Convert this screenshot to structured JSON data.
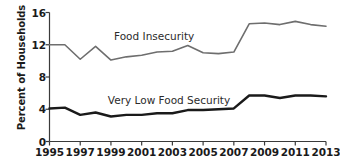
{
  "chart_data": {
    "type": "line",
    "title": "",
    "xlabel": "",
    "ylabel": "Percent of Households",
    "xlim": [
      1995,
      2013
    ],
    "ylim": [
      0,
      16
    ],
    "grid": false,
    "legend_position": "inline-annotation",
    "x": [
      1995,
      1996,
      1997,
      1998,
      1999,
      2000,
      2001,
      2002,
      2003,
      2004,
      2005,
      2006,
      2007,
      2008,
      2009,
      2010,
      2011,
      2012,
      2013
    ],
    "xticks": [
      "1995",
      "1997",
      "1999",
      "2001",
      "2003",
      "2005",
      "2007",
      "2009",
      "2011",
      "2013"
    ],
    "xtick_values": [
      1995,
      1997,
      1999,
      2001,
      2003,
      2005,
      2007,
      2009,
      2011,
      2013
    ],
    "yticks": [
      "0",
      "4",
      "8",
      "12",
      "16"
    ],
    "ytick_values": [
      0,
      4,
      8,
      12,
      16
    ],
    "series": [
      {
        "name": "Food Insecurity",
        "color": "#6e6e6e",
        "width": 1.6,
        "values": [
          12.0,
          12.0,
          10.2,
          11.8,
          10.1,
          10.5,
          10.7,
          11.1,
          11.2,
          11.9,
          11.0,
          10.9,
          11.1,
          14.6,
          14.7,
          14.5,
          14.9,
          14.5,
          14.3
        ]
      },
      {
        "name": "Very Low Food Security",
        "color": "#1a1a1a",
        "width": 2.4,
        "values": [
          4.1,
          4.2,
          3.3,
          3.6,
          3.1,
          3.3,
          3.3,
          3.5,
          3.5,
          3.9,
          3.9,
          4.0,
          4.1,
          5.7,
          5.7,
          5.4,
          5.7,
          5.7,
          5.6
        ]
      }
    ],
    "annotations": [
      {
        "text": "Food Insecurity",
        "x": 1999.2,
        "y": 12.95
      },
      {
        "text": "Very Low Food Security",
        "x": 1998.8,
        "y": 5.05
      }
    ]
  }
}
